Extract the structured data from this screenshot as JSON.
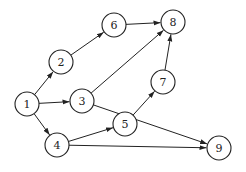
{
  "graph": {
    "type": "directed",
    "node_radius": 12,
    "nodes": [
      {
        "id": "1",
        "label": "1",
        "x": 27,
        "y": 104
      },
      {
        "id": "2",
        "label": "2",
        "x": 61,
        "y": 62
      },
      {
        "id": "3",
        "label": "3",
        "x": 82,
        "y": 101
      },
      {
        "id": "4",
        "label": "4",
        "x": 57,
        "y": 145
      },
      {
        "id": "5",
        "label": "5",
        "x": 125,
        "y": 124
      },
      {
        "id": "6",
        "label": "6",
        "x": 114,
        "y": 25
      },
      {
        "id": "7",
        "label": "7",
        "x": 163,
        "y": 82
      },
      {
        "id": "8",
        "label": "8",
        "x": 173,
        "y": 22
      },
      {
        "id": "9",
        "label": "9",
        "x": 219,
        "y": 148
      }
    ],
    "edges": [
      {
        "from": "1",
        "to": "2"
      },
      {
        "from": "1",
        "to": "3"
      },
      {
        "from": "1",
        "to": "4"
      },
      {
        "from": "2",
        "to": "6"
      },
      {
        "from": "6",
        "to": "8"
      },
      {
        "from": "3",
        "to": "8"
      },
      {
        "from": "3",
        "to": "9"
      },
      {
        "from": "7",
        "to": "8"
      },
      {
        "from": "4",
        "to": "5"
      },
      {
        "from": "4",
        "to": "9"
      },
      {
        "from": "5",
        "to": "7"
      }
    ]
  }
}
